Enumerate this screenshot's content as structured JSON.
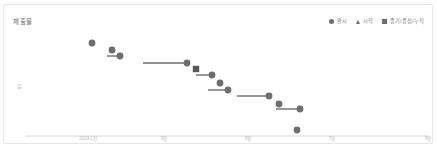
{
  "chart_title": "제출물",
  "legend": {
    "items": [
      {
        "label": "완시",
        "marker": "circle-marker",
        "color": "#6e6e6e"
      },
      {
        "label": "시작",
        "marker": "triangle-marker",
        "color": "#6e6e6e"
      },
      {
        "label": "종기/종점/누적",
        "marker": "square-marker",
        "color": "#6e6e6e"
      }
    ]
  },
  "axes": {
    "y_tick_label": "일",
    "x_tick_labels": [
      "2023 1월",
      "3월",
      "5월",
      "7월",
      "9월"
    ]
  },
  "chart_data": {
    "type": "scatter",
    "title": "제출물",
    "xlabel": "",
    "ylabel": "일",
    "grid": false,
    "legend_position": "top-right",
    "xlim": [
      0,
      430
    ],
    "ylim": [
      0,
      140
    ],
    "x_tick_positions": [
      84,
      160,
      244,
      328,
      424
    ],
    "x_tick_labels": [
      "2023 1월",
      "3월",
      "5월",
      "7월",
      "9월"
    ],
    "y_axis_line_y": 131,
    "series": [
      {
        "name": "완시",
        "marker": "circle",
        "color": "#6e6e6e",
        "points": [
          {
            "x": 88,
            "y": 38,
            "bar_start_x": null
          },
          {
            "x": 108,
            "y": 45,
            "bar_start_x": null
          },
          {
            "x": 116,
            "y": 51,
            "bar_start_x": 103
          },
          {
            "x": 183,
            "y": 58,
            "bar_start_x": 139
          },
          {
            "x": 208,
            "y": 70,
            "bar_start_x": 192
          },
          {
            "x": 216,
            "y": 78,
            "bar_start_x": null
          },
          {
            "x": 224,
            "y": 85,
            "bar_start_x": 204
          },
          {
            "x": 265,
            "y": 91,
            "bar_start_x": 233
          },
          {
            "x": 275,
            "y": 99,
            "bar_start_x": null
          },
          {
            "x": 296,
            "y": 104,
            "bar_start_x": 272
          },
          {
            "x": 293,
            "y": 125,
            "bar_start_x": null
          }
        ]
      },
      {
        "name": "종기/종점/누적",
        "marker": "square",
        "color": "#565656",
        "points": [
          {
            "x": 192,
            "y": 64,
            "bar_start_x": null
          }
        ]
      }
    ]
  }
}
